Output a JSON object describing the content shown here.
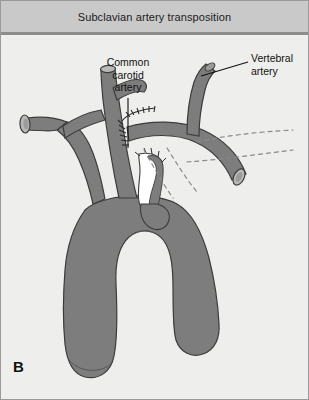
{
  "figure": {
    "title": "Subclavian artery transposition",
    "panel_letter": "B",
    "background_color": "#eeeeec",
    "title_bar_color": "#c9c9c9",
    "vessel_fill": "#7d7d7d",
    "vessel_stroke": "#3c3c3c",
    "lumen_fill": "#b9b9b9",
    "dashed_color": "#8a8a8a",
    "leader_color": "#111111"
  },
  "labels": {
    "carotid": {
      "line1": "Common",
      "line2": "carotid",
      "line3": "artery"
    },
    "vertebral": {
      "line1": "Vertebral",
      "line2": "artery"
    }
  },
  "anatomy": {
    "structures": [
      "aortic arch",
      "ascending aorta",
      "descending aorta",
      "brachiocephalic trunk",
      "left common carotid artery",
      "left subclavian artery transposed",
      "vertebral artery",
      "right subclavian stump",
      "oversewn subclavian origin stump"
    ],
    "suture_line": "end-to-side anastomosis of subclavian artery to common carotid artery",
    "dashed_lines_meaning": "original course of the subclavian artery before transposition"
  }
}
